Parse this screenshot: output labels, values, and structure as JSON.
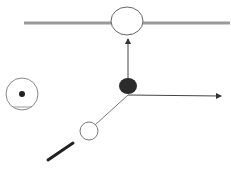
{
  "diagram": {
    "type": "physics-schematic",
    "colors": {
      "rail": "#9a9a9a",
      "stroke": "#555555",
      "filled_node": "#2b2b2b",
      "thick_bar": "#222222",
      "background": "#ffffff"
    },
    "elements": {
      "rail": {
        "x1": 24,
        "y1": 23,
        "x2": 230,
        "y2": 23,
        "width": 3
      },
      "top_circle": {
        "cx": 127,
        "cy": 21,
        "rx": 16,
        "ry": 14
      },
      "vertical_arrow": {
        "x1": 128,
        "y1": 79,
        "x2": 128,
        "y2": 38
      },
      "filled_node": {
        "cx": 128,
        "cy": 86,
        "rx": 9,
        "ry": 8
      },
      "horizontal_arrow": {
        "x1": 128,
        "y1": 95,
        "x2": 222,
        "y2": 96
      },
      "diagonal_link": {
        "x1": 128,
        "y1": 95,
        "x2": 95,
        "y2": 125
      },
      "small_circle": {
        "cx": 89,
        "cy": 131,
        "r": 9
      },
      "target_outer": {
        "cx": 22,
        "cy": 94,
        "r": 16
      },
      "target_dot": {
        "cx": 22,
        "cy": 94,
        "r": 3
      },
      "target_underline": {
        "x1": 13,
        "y1": 107,
        "x2": 32,
        "y2": 107
      },
      "thick_bar": {
        "x1": 48,
        "y1": 160,
        "x2": 73,
        "y2": 143,
        "width": 3
      }
    }
  },
  "caption": {
    "text": "",
    "truncated": true
  }
}
